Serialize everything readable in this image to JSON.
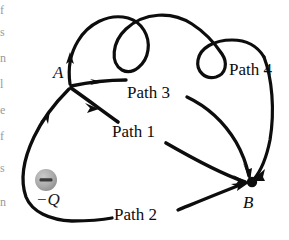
{
  "figure": {
    "background_color": "#ffffff",
    "ink_color": "#0d0d0d",
    "charge_fill_color": "#a8a8a8",
    "nodes": [
      {
        "id": "A",
        "label": "A",
        "x": 70,
        "y": 86,
        "label_x": 53,
        "label_y": 78,
        "type": "junction"
      },
      {
        "id": "B",
        "label": "B",
        "x": 252,
        "y": 182,
        "label_x": 243,
        "label_y": 208,
        "type": "endpoint-dot"
      }
    ],
    "charge": {
      "symbol": "−",
      "label": "−Q",
      "x": 46,
      "y": 180,
      "radius": 11,
      "label_x": 36,
      "label_y": 205,
      "fill": "#a8a8a8"
    },
    "paths": [
      {
        "id": "path1",
        "label": "Path 1",
        "label_x": 112,
        "label_y": 137,
        "description": "straight segment from A down-right to B"
      },
      {
        "id": "path2",
        "label": "Path 2",
        "label_x": 114,
        "label_y": 220,
        "description": "wide loop from A down-left around the charge then right to B"
      },
      {
        "id": "path3",
        "label": "Path 3",
        "label_x": 127,
        "label_y": 98,
        "description": "gentle arc from A right then curving down to B"
      },
      {
        "id": "path4",
        "label": "Path 4",
        "label_x": 229,
        "label_y": 75,
        "description": "looping curly path from A up over two curls then down to B"
      }
    ],
    "edge_fragments": [
      "f",
      "s",
      "n",
      "l",
      "e",
      "f",
      "s",
      "n"
    ]
  }
}
